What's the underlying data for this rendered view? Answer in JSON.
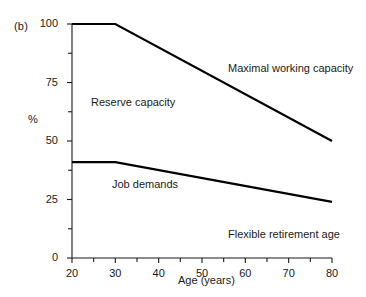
{
  "figure": {
    "panel_label": "(b)",
    "annotations": [
      {
        "id": "maximal-working-capacity",
        "text": "Maximal working capacity",
        "x": 228,
        "y": 62
      },
      {
        "id": "reserve-capacity",
        "text": "Reserve capacity",
        "x": 91,
        "y": 96
      },
      {
        "id": "job-demands",
        "text": "Job demands",
        "x": 112,
        "y": 178
      },
      {
        "id": "flexible-retirement-age",
        "text": "Flexible retirement age",
        "x": 228,
        "y": 228
      }
    ],
    "line_color": "#000000",
    "axis_color": "#1a1a1a",
    "text_color": "#1a1a1a"
  },
  "chart_data": {
    "type": "line",
    "title": "",
    "subtitle": "",
    "xlabel": "Age (years)",
    "ylabel": "%",
    "xlim": [
      20,
      80
    ],
    "ylim": [
      0,
      100
    ],
    "xticks": [
      20,
      30,
      40,
      50,
      60,
      70,
      80
    ],
    "xtick_labels": [
      "20",
      "30",
      "40",
      "50",
      "60",
      "70",
      "80"
    ],
    "xminor_ticks": [
      25,
      35,
      45,
      55,
      65,
      75
    ],
    "yticks": [
      0,
      25,
      50,
      75,
      100
    ],
    "ytick_labels": [
      "0",
      "25",
      "50",
      "75",
      "100"
    ],
    "yminor_ticks": [
      12.5,
      37.5,
      62.5,
      87.5
    ],
    "grid": false,
    "legend": "none",
    "series": [
      {
        "name": "Maximal working capacity",
        "x": [
          20,
          30,
          80
        ],
        "values": [
          100,
          100,
          50
        ]
      },
      {
        "name": "Job demands",
        "x": [
          20,
          30,
          80
        ],
        "values": [
          41,
          41,
          24
        ]
      }
    ],
    "regions": [
      {
        "name": "Reserve capacity",
        "between": [
          "Maximal working capacity",
          "Job demands"
        ]
      },
      {
        "name": "Flexible retirement age",
        "below": "Job demands"
      }
    ]
  }
}
